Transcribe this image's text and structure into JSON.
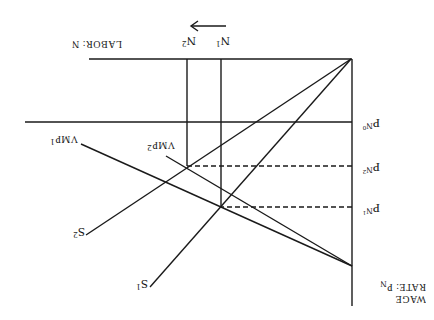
{
  "diagram": {
    "type": "labor-market-supply-demand",
    "orientation": "rotated-180",
    "axes": {
      "y_label_line1": "WAGE",
      "y_label_line2": "RATE: P",
      "y_label_sub": "N",
      "x_label": "LABOR: N"
    },
    "price_levels": [
      {
        "main": "P",
        "sub": "N",
        "subsub": "1"
      },
      {
        "main": "P",
        "sub": "N",
        "subsub": "2"
      },
      {
        "main": "P",
        "sub": "N",
        "subsub": "0"
      }
    ],
    "quantity_levels": [
      {
        "main": "N",
        "sub": "1"
      },
      {
        "main": "N",
        "sub": "2"
      }
    ],
    "curves": [
      {
        "main": "VMP",
        "sub": "1"
      },
      {
        "main": "VMP",
        "sub": "2"
      },
      {
        "main": "S",
        "sub": "1"
      },
      {
        "main": "S",
        "sub": "2"
      }
    ],
    "arrow": "shift-right"
  }
}
